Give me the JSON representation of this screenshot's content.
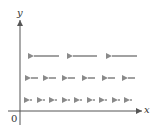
{
  "diagram": {
    "title": "",
    "type": "vector-field",
    "axes": {
      "x_label": "x",
      "y_label": "y",
      "origin_label": "0"
    },
    "colors": {
      "axis": "#555555",
      "arrow": "#8a8a8a"
    },
    "rows": [
      {
        "y": 56,
        "arrows": [
          [
            59,
            29
          ],
          [
            97,
            68
          ],
          [
            137,
            107
          ]
        ]
      },
      {
        "y": 78,
        "arrows": [
          [
            38,
            26
          ],
          [
            56,
            44
          ],
          [
            75,
            63
          ],
          [
            95,
            83
          ],
          [
            115,
            103
          ],
          [
            135,
            123
          ]
        ]
      },
      {
        "y": 100,
        "arrows": [
          [
            32,
            25
          ],
          [
            45,
            38
          ],
          [
            57,
            50
          ],
          [
            70,
            63
          ],
          [
            82,
            75
          ],
          [
            95,
            88
          ],
          [
            107,
            100
          ],
          [
            120,
            113
          ],
          [
            132,
            125
          ]
        ]
      }
    ]
  }
}
